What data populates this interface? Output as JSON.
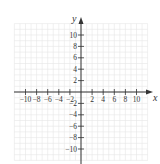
{
  "diagram": {
    "type": "coordinate-plane",
    "x_axis_label": "x",
    "y_axis_label": "y",
    "x_ticks": [
      -10,
      -8,
      -6,
      -4,
      -2,
      2,
      4,
      6,
      8,
      10
    ],
    "y_ticks": [
      10,
      8,
      6,
      4,
      2,
      -2,
      -4,
      -6,
      -8,
      -10
    ],
    "x_tick_labels": [
      "−10",
      "−8",
      "−6",
      "−4",
      "−2",
      "2",
      "4",
      "6",
      "8",
      "10"
    ],
    "y_tick_labels": [
      "10",
      "8",
      "6",
      "4",
      "2",
      "−2",
      "−4",
      "−6",
      "−8",
      "−10"
    ],
    "grid_range": [
      -12,
      12
    ],
    "grid_step": 1,
    "colors": {
      "axis": "#333333",
      "grid": "#e6e6e6",
      "background": "#ffffff"
    }
  }
}
